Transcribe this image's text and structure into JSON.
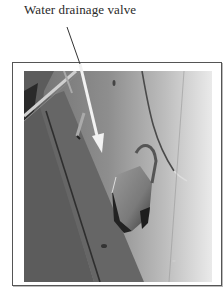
{
  "figure": {
    "caption": "Water drainage valve",
    "annotation_target": "valve",
    "colors": {
      "leader_line": "#333333",
      "arrow": "#f2f2f2",
      "frame_border": "#555555"
    }
  }
}
